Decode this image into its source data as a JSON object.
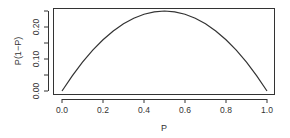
{
  "chart_data": {
    "type": "line",
    "title": "",
    "xlabel": "P",
    "ylabel": "P(1−P)",
    "xlim": [
      0.0,
      1.0
    ],
    "ylim": [
      0.0,
      0.25
    ],
    "x_ticks": [
      "0.0",
      "0.2",
      "0.4",
      "0.6",
      "0.8",
      "1.0"
    ],
    "x_tick_values": [
      0.0,
      0.2,
      0.4,
      0.6,
      0.8,
      1.0
    ],
    "y_ticks": [
      "0.00",
      "0.10",
      "0.20"
    ],
    "y_tick_values": [
      0.0,
      0.05,
      0.1,
      0.15,
      0.2,
      0.25
    ],
    "y_tick_labeled": [
      true,
      false,
      true,
      false,
      true,
      false
    ],
    "grid": false,
    "legend": null,
    "series": [
      {
        "name": "P(1-P)",
        "color": "#333333",
        "x": [
          0.0,
          0.05,
          0.1,
          0.15,
          0.2,
          0.25,
          0.3,
          0.35,
          0.4,
          0.45,
          0.5,
          0.55,
          0.6,
          0.65,
          0.7,
          0.75,
          0.8,
          0.85,
          0.9,
          0.95,
          1.0
        ],
        "y": [
          0.0,
          0.0475,
          0.09,
          0.1275,
          0.16,
          0.1875,
          0.21,
          0.2275,
          0.24,
          0.2475,
          0.25,
          0.2475,
          0.24,
          0.2275,
          0.21,
          0.1875,
          0.16,
          0.1275,
          0.09,
          0.0475,
          0.0
        ]
      }
    ]
  }
}
